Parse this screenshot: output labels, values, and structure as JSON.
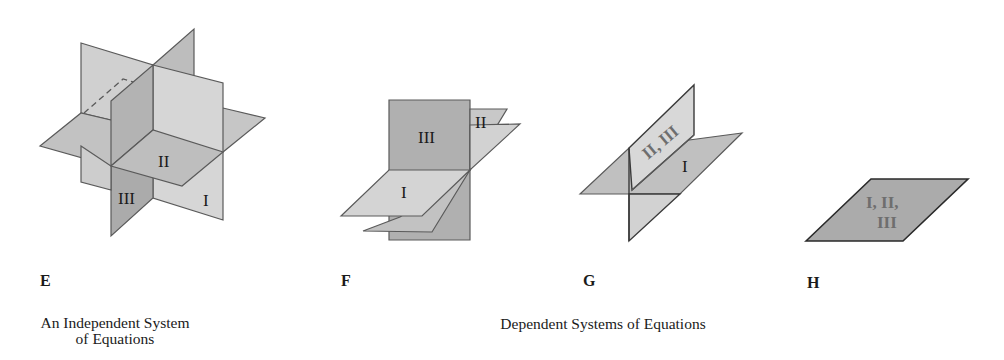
{
  "colors": {
    "plane_light": "#d3d3d3",
    "plane_mid": "#bdbdbd",
    "plane_dark": "#a9a9a9",
    "edge": "#5a5a5a",
    "text": "#1a1a1a",
    "label_grey": "#6e6e6e"
  },
  "figures": [
    {
      "letter": "E",
      "description": "Three planes intersecting at a single point",
      "plane_labels": [
        "I",
        "II",
        "III"
      ]
    },
    {
      "letter": "F",
      "description": "Three planes intersecting along a common line",
      "plane_labels": [
        "III",
        "II",
        "I"
      ]
    },
    {
      "letter": "G",
      "description": "Two coincident planes intersecting a third plane in a line",
      "plane_labels": [
        "II, III",
        "I"
      ]
    },
    {
      "letter": "H",
      "description": "Three coincident planes",
      "plane_labels": [
        "I, II,",
        "III"
      ]
    }
  ],
  "captions": {
    "independent_line1": "An Independent System",
    "independent_line2": "of Equations",
    "dependent": "Dependent Systems of Equations"
  }
}
